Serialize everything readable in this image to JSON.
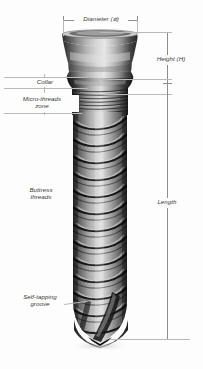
{
  "figure": {
    "background_color": "#fdfdfd",
    "line_color": "#b9b9b9",
    "label_color": "#3a3a3a"
  },
  "dimensions": [
    {
      "id": "diameter",
      "label": "Diameter (⌀)",
      "orientation": "horizontal",
      "position": {
        "x1": 63,
        "x2": 138,
        "y": 20
      },
      "measures": "implant head outer width"
    },
    {
      "id": "height",
      "label": "Height (H)",
      "orientation": "vertical",
      "position": {
        "x": 167,
        "y1": 32,
        "y2": 95
      },
      "measures": "abutment / head height"
    },
    {
      "id": "length",
      "label": "Length",
      "orientation": "vertical",
      "position": {
        "x": 167,
        "y1": 83,
        "y2": 340
      },
      "measures": "overall threaded body length"
    }
  ],
  "zones": [
    {
      "id": "collar",
      "label": "Collar",
      "side": "left",
      "label_position": {
        "x": 8,
        "y": 80
      },
      "band": {
        "top": 77,
        "bottom": 88
      }
    },
    {
      "id": "micro-threads-zone",
      "label": "Micro-threads\nzone",
      "side": "left",
      "label_position": {
        "x": 4,
        "y": 96
      },
      "band": {
        "top": 88,
        "bottom": 114
      }
    },
    {
      "id": "buttress-threads",
      "label": "Buttress\nthreads",
      "side": "left",
      "label_position": {
        "x": 10,
        "y": 186
      },
      "band": {
        "top": 114,
        "bottom": 300
      }
    },
    {
      "id": "self-tapping-groove",
      "label": "Self-tapping\ngroove",
      "side": "left",
      "label_position": {
        "x": 8,
        "y": 293
      },
      "band": {
        "top": 300,
        "bottom": 345
      }
    }
  ],
  "implant": {
    "head_top_y": 32,
    "head_bottom_y": 77,
    "body_top_y": 88,
    "tip_y": 345,
    "center_x": 100,
    "body_half_width": 27,
    "head_half_width": 38,
    "thread_count": 13,
    "material_tone": "#9a9a9a"
  }
}
